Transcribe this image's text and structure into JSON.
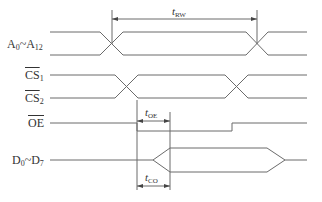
{
  "diagram": {
    "type": "timing-diagram",
    "signals": [
      {
        "id": "address",
        "label": "A",
        "sub_start": "0",
        "sep": "~",
        "label_end": "A",
        "sub_end": "12",
        "overline": false
      },
      {
        "id": "cs1",
        "label": "CS",
        "sub": "1",
        "overline": true
      },
      {
        "id": "cs2",
        "label": "CS",
        "sub": "2",
        "overline": true
      },
      {
        "id": "oe",
        "label": "OE",
        "overline": true
      },
      {
        "id": "data",
        "label": "D",
        "sub_start": "0",
        "sep": "~",
        "label_end": "D",
        "sub_end": "7",
        "overline": false
      }
    ],
    "timings": [
      {
        "id": "t_rw",
        "t": "t",
        "sub": "RW"
      },
      {
        "id": "t_oe",
        "t": "t",
        "sub": "OE"
      },
      {
        "id": "t_co",
        "t": "t",
        "sub": "CO"
      }
    ],
    "colors": {
      "line": "#6b6b6b",
      "text": "#333333",
      "background": "#ffffff"
    }
  }
}
